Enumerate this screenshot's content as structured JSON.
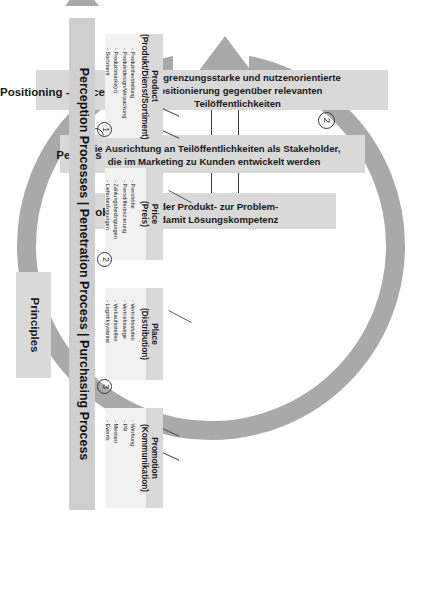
{
  "diagram": {
    "orientation_note": "rotated 90 degrees",
    "colors": {
      "ring": "#a9a9a9",
      "column_shade": "#d9d9d9",
      "column_fill": "#f0f0f0",
      "tile_fill": "#f2f2f2",
      "process_bar": "#cfcfcf",
      "text": "#1a1a1a"
    }
  },
  "stages": [
    {
      "id": "problem",
      "title": "Problem",
      "body": "Von der Produkt- zur Problem-\nund damit Lösungskompetenz"
    },
    {
      "id": "persons",
      "title": "Persons",
      "body": "Die Ausrichtung an Teilöffentlichkeiten als Stakeholder,\ndie im Marketing zu Kunden entwickelt werden"
    },
    {
      "id": "positioning",
      "title": "Positioning - Process",
      "body": "Die abgrenzungsstarke und nutzenorientierte\nPositionierung gegenüber relevanten\nTeilöffentlichkeiten"
    }
  ],
  "marketing_mix": [
    {
      "id": "product",
      "title": "Product",
      "subtitle": "(Produkt/Dienst/Sortiment)",
      "items": [
        "Produktherstellung",
        "Produktdesign/Verpackung",
        "Produktmarke(n)",
        "Sortiment"
      ]
    },
    {
      "id": "price",
      "title": "Price",
      "subtitle": "(Preis)",
      "items": [
        "Preishöhe",
        "Preisdifferenzierung",
        "Zahlungsbedingungen",
        "Lieferbedingungen"
      ]
    },
    {
      "id": "place",
      "title": "Place",
      "subtitle": "(Distribution)",
      "items": [
        "Vertriebsstufen",
        "Vertriebswege",
        "Verkaufsstellen",
        "Logistiksysteme"
      ]
    },
    {
      "id": "promotion",
      "title": "Promotion",
      "subtitle": "(Kommunikation)",
      "items": [
        "Werbung",
        "PR",
        "Messen",
        "Events"
      ]
    }
  ],
  "process_bar": {
    "label": "Perception Processes | Penetration Process | Purchasing Process",
    "markers": [
      "1",
      "2",
      "3"
    ]
  },
  "principles": {
    "title": "Principles"
  },
  "ring_markers": {
    "one": "1",
    "two": "2",
    "three": "3"
  }
}
